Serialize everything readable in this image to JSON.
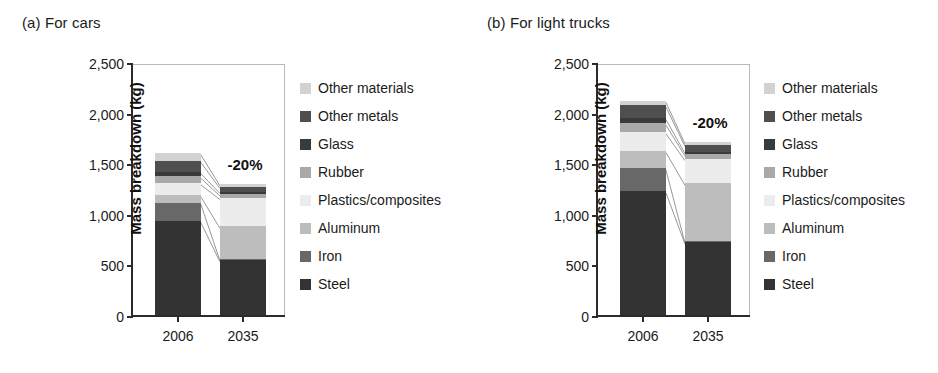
{
  "figure": {
    "panels": [
      {
        "title": "(a) For cars",
        "annotation": "-20%"
      },
      {
        "title": "(b) For light trucks",
        "annotation": "-20%"
      }
    ]
  },
  "axis": {
    "ylabel": "Mass breakdown (kg)",
    "yticks": [
      "0",
      "500",
      "1,000",
      "1,500",
      "2,000",
      "2,500"
    ],
    "xticks": [
      "2006",
      "2035"
    ]
  },
  "legend": {
    "items": [
      {
        "label": "Other materials",
        "color": "#d2d2d2"
      },
      {
        "label": "Other metals",
        "color": "#4f4f4f"
      },
      {
        "label": "Glass",
        "color": "#3a3a3a"
      },
      {
        "label": "Rubber",
        "color": "#a9a9a9"
      },
      {
        "label": "Plastics/composites",
        "color": "#ececec"
      },
      {
        "label": "Aluminum",
        "color": "#bdbdbd"
      },
      {
        "label": "Iron",
        "color": "#686868"
      },
      {
        "label": "Steel",
        "color": "#333333"
      }
    ]
  },
  "chart_data": [
    {
      "type": "bar",
      "title": "(a) For cars",
      "stacked": true,
      "xlabel": "",
      "ylabel": "Mass breakdown (kg)",
      "ylim": [
        0,
        2500
      ],
      "ytick_step": 500,
      "grid": false,
      "legend_position": "right",
      "categories": [
        "2006",
        "2035"
      ],
      "series": [
        {
          "name": "Steel",
          "values": [
            930,
            545
          ],
          "color": "#333333"
        },
        {
          "name": "Iron",
          "values": [
            180,
            10
          ],
          "color": "#686868"
        },
        {
          "name": "Aluminum",
          "values": [
            75,
            320
          ],
          "color": "#bdbdbd"
        },
        {
          "name": "Plastics/composites",
          "values": [
            120,
            285
          ],
          "color": "#ececec"
        },
        {
          "name": "Rubber",
          "values": [
            65,
            35
          ],
          "color": "#a9a9a9"
        },
        {
          "name": "Glass",
          "values": [
            45,
            25
          ],
          "color": "#3a3a3a"
        },
        {
          "name": "Other metals",
          "values": [
            110,
            50
          ],
          "color": "#4f4f4f"
        },
        {
          "name": "Other materials",
          "values": [
            75,
            25
          ],
          "color": "#d2d2d2"
        }
      ],
      "totals": [
        1600,
        1295
      ],
      "annotations": [
        {
          "text": "-20%",
          "near": "2035"
        }
      ]
    },
    {
      "type": "bar",
      "title": "(b) For light trucks",
      "stacked": true,
      "xlabel": "",
      "ylabel": "Mass breakdown (kg)",
      "ylim": [
        0,
        2500
      ],
      "ytick_step": 500,
      "grid": false,
      "legend_position": "right",
      "categories": [
        "2006",
        "2035"
      ],
      "series": [
        {
          "name": "Steel",
          "values": [
            1225,
            720
          ],
          "color": "#333333"
        },
        {
          "name": "Iron",
          "values": [
            225,
            10
          ],
          "color": "#686868"
        },
        {
          "name": "Aluminum",
          "values": [
            175,
            570
          ],
          "color": "#bdbdbd"
        },
        {
          "name": "Plastics/composites",
          "values": [
            185,
            245
          ],
          "color": "#ececec"
        },
        {
          "name": "Rubber",
          "values": [
            85,
            45
          ],
          "color": "#a9a9a9"
        },
        {
          "name": "Glass",
          "values": [
            55,
            25
          ],
          "color": "#3a3a3a"
        },
        {
          "name": "Other metals",
          "values": [
            125,
            70
          ],
          "color": "#4f4f4f"
        },
        {
          "name": "Other materials",
          "values": [
            45,
            25
          ],
          "color": "#d2d2d2"
        }
      ],
      "totals": [
        2120,
        1710
      ],
      "annotations": [
        {
          "text": "-20%",
          "near": "2035"
        }
      ]
    }
  ]
}
